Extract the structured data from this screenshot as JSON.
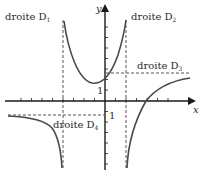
{
  "diagram": {
    "type": "function-graph-with-asymptotes",
    "axes": {
      "x_label": "x",
      "y_label": "y",
      "x_unit_label": "1",
      "y_unit_label": "1"
    },
    "asymptotes": [
      {
        "id": "D1",
        "label": "droite D",
        "subscript": "1",
        "orientation": "vertical",
        "equation_hint": "x = -4"
      },
      {
        "id": "D2",
        "label": "droite D",
        "subscript": "2",
        "orientation": "vertical",
        "equation_hint": "x = 2"
      },
      {
        "id": "D3",
        "label": "droite D",
        "subscript": "3",
        "orientation": "horizontal",
        "equation_hint": "y = 3"
      },
      {
        "id": "D4",
        "label": "droite D",
        "subscript": "4",
        "orientation": "horizontal",
        "equation_hint": "y = -1"
      }
    ],
    "curves": [
      {
        "name": "middle-branch",
        "description": "U-shaped branch between D1 and D2, minimum slightly left of the y-axis"
      },
      {
        "name": "left-branch",
        "description": "approaches D4 as x -> -inf, goes to -inf at D1"
      },
      {
        "name": "right-branch",
        "description": "goes to -inf at D2, crosses x-axis near x=4, approaches D3 as x -> +inf"
      }
    ],
    "colors": {
      "axis": "#1a1a1a",
      "curve": "#4a4a4a",
      "dashed": "#555555",
      "text": "#2a2a2a"
    }
  }
}
